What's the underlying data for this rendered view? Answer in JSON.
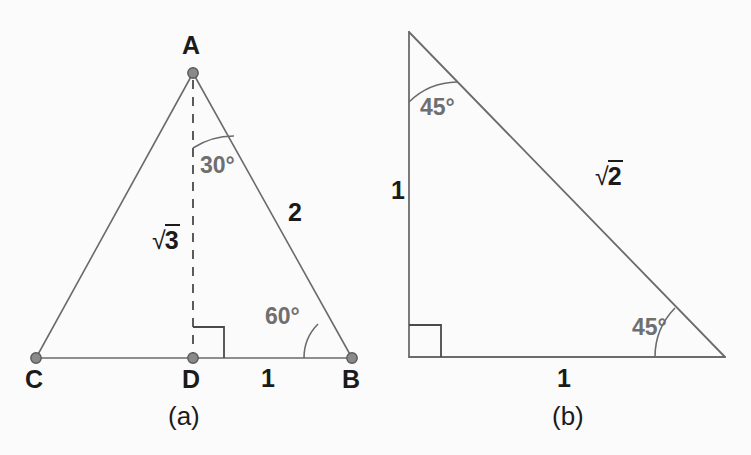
{
  "figure": {
    "background_color": "#fbfbfb",
    "line_color": "#6b6b6b",
    "dark_line_color": "#4a4a4a",
    "vertex_fill_color": "#8a8a8a",
    "vertex_stroke_color": "#5a5a5a",
    "text_color": "#1b1b1b",
    "angle_text_color": "#6f6f6f"
  },
  "panel_a": {
    "caption": "(a)",
    "vertices": {
      "apex": "A",
      "left": "C",
      "foot": "D",
      "right": "B"
    },
    "angles": {
      "apex_half": "30°",
      "base_right": "60°",
      "foot_right_angle": "90°"
    },
    "sides": {
      "altitude": {
        "sign": "√",
        "body": "3"
      },
      "hypotenuse": "2",
      "half_base": "1"
    }
  },
  "panel_b": {
    "caption": "(b)",
    "angles": {
      "top": "45°",
      "bottom_right": "45°",
      "bottom_left_right_angle": "90°"
    },
    "sides": {
      "vertical_leg": "1",
      "horizontal_leg": "1",
      "hypotenuse": {
        "sign": "√",
        "body": "2"
      }
    }
  }
}
